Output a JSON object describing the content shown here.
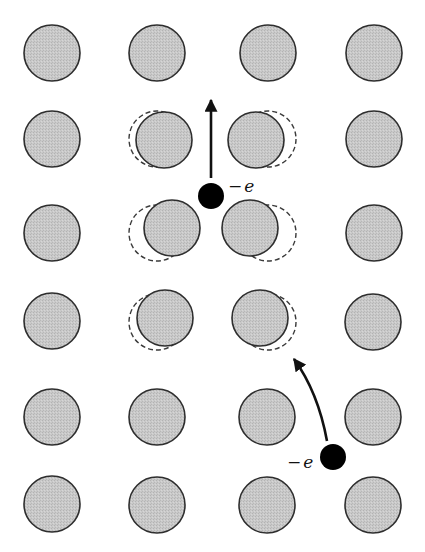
{
  "diagram": {
    "colors": {
      "background": "#ffffff",
      "ion_fill": "#c6c6c6",
      "ion_stroke": "#2e2e2e",
      "dashed_stroke": "#3a3a3a",
      "electron_fill": "#000000",
      "arrow": "#111111"
    },
    "ion_radius": 28,
    "ions": [
      {
        "row": 1,
        "col": 1,
        "cx": 52,
        "cy": 53
      },
      {
        "row": 1,
        "col": 2,
        "cx": 157,
        "cy": 53
      },
      {
        "row": 1,
        "col": 3,
        "cx": 268,
        "cy": 53
      },
      {
        "row": 1,
        "col": 4,
        "cx": 374,
        "cy": 53
      },
      {
        "row": 2,
        "col": 1,
        "cx": 52,
        "cy": 139
      },
      {
        "row": 2,
        "col": 2,
        "cx": 164,
        "cy": 140,
        "displaced": true,
        "original": {
          "cx": 157,
          "cy": 139
        }
      },
      {
        "row": 2,
        "col": 3,
        "cx": 256,
        "cy": 140,
        "displaced": true,
        "original": {
          "cx": 268,
          "cy": 139
        }
      },
      {
        "row": 2,
        "col": 4,
        "cx": 374,
        "cy": 139
      },
      {
        "row": 3,
        "col": 1,
        "cx": 52,
        "cy": 233
      },
      {
        "row": 3,
        "col": 2,
        "cx": 172,
        "cy": 228,
        "displaced": true,
        "original": {
          "cx": 157,
          "cy": 233
        }
      },
      {
        "row": 3,
        "col": 3,
        "cx": 250,
        "cy": 228,
        "displaced": true,
        "original": {
          "cx": 268,
          "cy": 233
        }
      },
      {
        "row": 3,
        "col": 4,
        "cx": 374,
        "cy": 233
      },
      {
        "row": 4,
        "col": 1,
        "cx": 52,
        "cy": 321
      },
      {
        "row": 4,
        "col": 2,
        "cx": 165,
        "cy": 318,
        "displaced": true,
        "original": {
          "cx": 157,
          "cy": 322
        }
      },
      {
        "row": 4,
        "col": 3,
        "cx": 260,
        "cy": 318,
        "displaced": true,
        "original": {
          "cx": 268,
          "cy": 322
        }
      },
      {
        "row": 4,
        "col": 4,
        "cx": 373,
        "cy": 322
      },
      {
        "row": 5,
        "col": 1,
        "cx": 52,
        "cy": 417
      },
      {
        "row": 5,
        "col": 2,
        "cx": 157,
        "cy": 417
      },
      {
        "row": 5,
        "col": 3,
        "cx": 267,
        "cy": 417
      },
      {
        "row": 5,
        "col": 4,
        "cx": 373,
        "cy": 417
      },
      {
        "row": 6,
        "col": 1,
        "cx": 52,
        "cy": 504
      },
      {
        "row": 6,
        "col": 2,
        "cx": 157,
        "cy": 505
      },
      {
        "row": 6,
        "col": 3,
        "cx": 267,
        "cy": 505
      },
      {
        "row": 6,
        "col": 4,
        "cx": 373,
        "cy": 505
      }
    ],
    "electrons": [
      {
        "id": "electron-1",
        "cx": 211,
        "cy": 196,
        "r": 13,
        "label": "−e",
        "label_dash": "−",
        "label_e": "e",
        "label_x": 228,
        "label_y": 192,
        "arrow": {
          "type": "straight",
          "from": [
            211,
            178
          ],
          "to": [
            211,
            100
          ]
        }
      },
      {
        "id": "electron-2",
        "cx": 333,
        "cy": 457,
        "r": 13,
        "label": "−e",
        "label_dash": "−",
        "label_e": "e",
        "label_x": 287,
        "label_y": 468,
        "arrow": {
          "type": "curved",
          "from": [
            327,
            441
          ],
          "control": [
            318,
            392
          ],
          "to": [
            294,
            359
          ]
        }
      }
    ]
  }
}
